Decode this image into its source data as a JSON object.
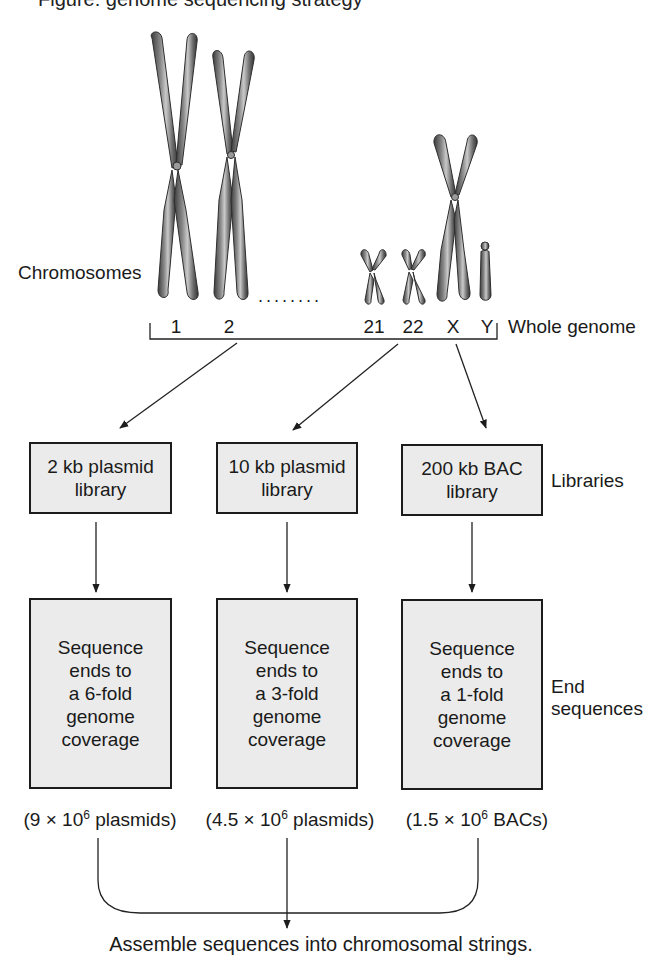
{
  "header": {
    "cut_off_title": "Figure: genome sequencing strategy"
  },
  "chromosomes": {
    "label": "Chromosomes",
    "ellipsis": "........",
    "items": [
      {
        "id": "1",
        "label": "1"
      },
      {
        "id": "2",
        "label": "2"
      },
      {
        "id": "21",
        "label": "21"
      },
      {
        "id": "22",
        "label": "22"
      },
      {
        "id": "X",
        "label": "X"
      },
      {
        "id": "Y",
        "label": "Y"
      }
    ],
    "bracket_label": "Whole genome"
  },
  "libraries": {
    "row_label": "Libraries",
    "items": [
      {
        "line1": "2 kb plasmid",
        "line2": "library"
      },
      {
        "line1": "10 kb plasmid",
        "line2": "library"
      },
      {
        "line1": "200 kb BAC",
        "line2": "library"
      }
    ]
  },
  "end_sequences": {
    "row_label_line1": "End",
    "row_label_line2": "sequences",
    "items": [
      {
        "lines": [
          "Sequence",
          "ends to",
          "a 6-fold",
          "genome",
          "coverage"
        ],
        "count_prefix": "(9 × 10",
        "count_exp": "6",
        "count_suffix": " plasmids)"
      },
      {
        "lines": [
          "Sequence",
          "ends to",
          "a 3-fold",
          "genome",
          "coverage"
        ],
        "count_prefix": "(4.5 × 10",
        "count_exp": "6",
        "count_suffix": " plasmids)"
      },
      {
        "lines": [
          "Sequence",
          "ends to",
          "a 1-fold",
          "genome",
          "coverage"
        ],
        "count_prefix": "(1.5 × 10",
        "count_exp": "6",
        "count_suffix": " BACs)"
      }
    ]
  },
  "final_step": "Assemble sequences into chromosomal strings.",
  "colors": {
    "box_fill": "#ebebeb",
    "box_border": "#1c1c1c",
    "chromosome": "#5a5a5a",
    "line": "#222222"
  }
}
